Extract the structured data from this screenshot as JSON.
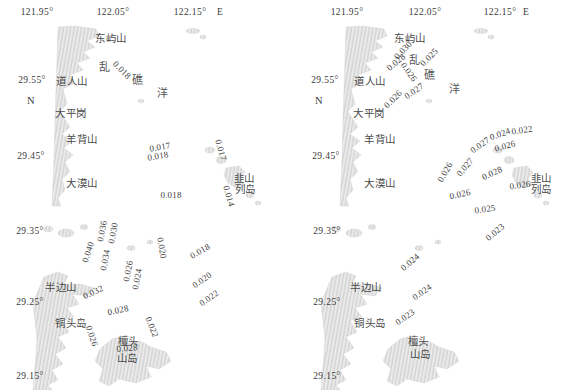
{
  "figure_type": "two-panel coastal map with point values",
  "colors": {
    "background": "#ffffff",
    "land_fill": "#eaeaea",
    "land_hatch": "#c2c2c2",
    "text": "#3d3d3d"
  },
  "panels": [
    {
      "name": "left-map",
      "lon_axis": {
        "y": 12,
        "ticks": [
          {
            "label": "121.95°",
            "x": 37
          },
          {
            "label": "122.05°",
            "x": 113
          },
          {
            "label": "122.15°",
            "x": 190
          }
        ],
        "suffix": {
          "label": "E",
          "x": 220
        }
      },
      "lat_ticks": [
        {
          "label": "29.55°",
          "x": 32,
          "y": 80
        },
        {
          "label": "29.45°",
          "x": 31,
          "y": 156
        },
        {
          "label": "29.35°",
          "x": 30,
          "y": 231
        },
        {
          "label": "29.25°",
          "x": 30,
          "y": 302
        },
        {
          "label": "29.15°",
          "x": 30,
          "y": 376
        }
      ],
      "north": {
        "label": "N",
        "x": 31,
        "y": 100
      },
      "sea_name": [
        {
          "char": "乱",
          "x": 104,
          "y": 66
        },
        {
          "char": "礁",
          "x": 137,
          "y": 79
        },
        {
          "char": "洋",
          "x": 162,
          "y": 92
        }
      ],
      "places": [
        {
          "label": "东屿山",
          "x": 111,
          "y": 37
        },
        {
          "label": "道人山",
          "x": 72,
          "y": 80
        },
        {
          "label": "大平岗",
          "x": 71,
          "y": 112
        },
        {
          "label": "羊背山",
          "x": 82,
          "y": 138
        },
        {
          "label": "大漠山",
          "x": 82,
          "y": 182
        },
        {
          "label": "韭山",
          "x": 244,
          "y": 177
        },
        {
          "label": "列岛",
          "x": 245,
          "y": 188
        },
        {
          "label": "半边山",
          "x": 61,
          "y": 286
        },
        {
          "label": "铜头岛",
          "x": 71,
          "y": 322
        },
        {
          "label": "檀头",
          "x": 128,
          "y": 340
        },
        {
          "label": "山岛",
          "x": 127,
          "y": 357
        }
      ],
      "values": [
        {
          "v": "0.018",
          "x": 122,
          "y": 70,
          "r": 45
        },
        {
          "v": "0.017",
          "x": 160,
          "y": 147,
          "r": -10
        },
        {
          "v": "0.018",
          "x": 158,
          "y": 156,
          "r": -10
        },
        {
          "v": "0.017",
          "x": 221,
          "y": 150,
          "r": 75
        },
        {
          "v": "0.014",
          "x": 229,
          "y": 196,
          "r": 75
        },
        {
          "v": "0.018",
          "x": 171,
          "y": 195,
          "r": 0
        },
        {
          "v": "0.036",
          "x": 102,
          "y": 231,
          "r": -80
        },
        {
          "v": "0.030",
          "x": 113,
          "y": 233,
          "r": -80
        },
        {
          "v": "0.040",
          "x": 88,
          "y": 252,
          "r": -72
        },
        {
          "v": "0.034",
          "x": 105,
          "y": 260,
          "r": -80
        },
        {
          "v": "0.026",
          "x": 128,
          "y": 271,
          "r": -80
        },
        {
          "v": "0.024",
          "x": 137,
          "y": 279,
          "r": -80
        },
        {
          "v": "0.020",
          "x": 162,
          "y": 248,
          "r": 80
        },
        {
          "v": "0.018",
          "x": 200,
          "y": 251,
          "r": -30
        },
        {
          "v": "0.020",
          "x": 202,
          "y": 280,
          "r": -35
        },
        {
          "v": "0.022",
          "x": 209,
          "y": 298,
          "r": -35
        },
        {
          "v": "0.032",
          "x": 93,
          "y": 292,
          "r": -25
        },
        {
          "v": "0.028",
          "x": 118,
          "y": 310,
          "r": -12
        },
        {
          "v": "0.022",
          "x": 152,
          "y": 327,
          "r": 68
        },
        {
          "v": "0.026",
          "x": 92,
          "y": 336,
          "r": 72
        },
        {
          "v": "0.028",
          "x": 127,
          "y": 348,
          "r": -5
        }
      ]
    },
    {
      "name": "right-map",
      "lon_axis": {
        "y": 12,
        "ticks": [
          {
            "label": "121.95°",
            "x": 347
          },
          {
            "label": "122.05°",
            "x": 425
          },
          {
            "label": "122.15°",
            "x": 500
          }
        ],
        "suffix": {
          "label": "E",
          "x": 526
        }
      },
      "lat_ticks": [
        {
          "label": "29.55°",
          "x": 325,
          "y": 80
        },
        {
          "label": "29.45°",
          "x": 326,
          "y": 156
        },
        {
          "label": "29.35°",
          "x": 327,
          "y": 231
        },
        {
          "label": "29.25°",
          "x": 327,
          "y": 302
        },
        {
          "label": "29.15°",
          "x": 327,
          "y": 376
        }
      ],
      "north": {
        "label": "N",
        "x": 319,
        "y": 100
      },
      "sea_name": [
        {
          "char": "乱",
          "x": 414,
          "y": 59
        },
        {
          "char": "礁",
          "x": 429,
          "y": 74
        },
        {
          "char": "洋",
          "x": 454,
          "y": 88
        }
      ],
      "places": [
        {
          "label": "东屿山",
          "x": 410,
          "y": 37
        },
        {
          "label": "道人山",
          "x": 370,
          "y": 80
        },
        {
          "label": "大平岗",
          "x": 369,
          "y": 112
        },
        {
          "label": "羊背山",
          "x": 380,
          "y": 138
        },
        {
          "label": "大漠山",
          "x": 380,
          "y": 182
        },
        {
          "label": "韭山",
          "x": 541,
          "y": 177
        },
        {
          "label": "列岛",
          "x": 541,
          "y": 188
        },
        {
          "label": "半边山",
          "x": 366,
          "y": 286
        },
        {
          "label": "铜头岛",
          "x": 370,
          "y": 322
        },
        {
          "label": "檀头",
          "x": 418,
          "y": 340
        },
        {
          "label": "山岛",
          "x": 420,
          "y": 353
        }
      ],
      "values": [
        {
          "v": "0.030",
          "x": 403,
          "y": 50,
          "r": -45
        },
        {
          "v": "0.028",
          "x": 396,
          "y": 62,
          "r": -40
        },
        {
          "v": "0.025",
          "x": 429,
          "y": 57,
          "r": -45
        },
        {
          "v": "0.026",
          "x": 409,
          "y": 72,
          "r": 55
        },
        {
          "v": "0.027",
          "x": 414,
          "y": 91,
          "r": -35
        },
        {
          "v": "0.026",
          "x": 393,
          "y": 99,
          "r": -45
        },
        {
          "v": "0.027",
          "x": 480,
          "y": 145,
          "r": -35
        },
        {
          "v": "0.024",
          "x": 500,
          "y": 134,
          "r": -20
        },
        {
          "v": "0.022",
          "x": 522,
          "y": 130,
          "r": -8
        },
        {
          "v": "0.026",
          "x": 505,
          "y": 146,
          "r": -15
        },
        {
          "v": "0.026",
          "x": 445,
          "y": 172,
          "r": -60
        },
        {
          "v": "0.027",
          "x": 465,
          "y": 167,
          "r": -50
        },
        {
          "v": "0.028",
          "x": 492,
          "y": 173,
          "r": -25
        },
        {
          "v": "0.026",
          "x": 520,
          "y": 185,
          "r": -8
        },
        {
          "v": "0.026",
          "x": 460,
          "y": 194,
          "r": -12
        },
        {
          "v": "0.025",
          "x": 485,
          "y": 209,
          "r": -8
        },
        {
          "v": "0.023",
          "x": 495,
          "y": 232,
          "r": -40
        },
        {
          "v": "0.024",
          "x": 410,
          "y": 262,
          "r": -40
        },
        {
          "v": "0.024",
          "x": 422,
          "y": 292,
          "r": -35
        },
        {
          "v": "0.023",
          "x": 405,
          "y": 317,
          "r": -35
        }
      ]
    }
  ]
}
